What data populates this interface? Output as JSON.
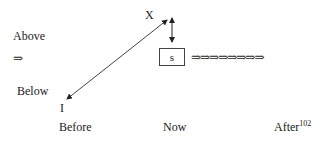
{
  "labels": {
    "above": "Above",
    "above_arrow": "⇒",
    "below": "Below",
    "x": "X",
    "i": "I",
    "box": "s",
    "before": "Before",
    "now": "Now",
    "after": "After",
    "after_sup": "102"
  },
  "arrow_chain": "⇒⇒⇒⇒⇒⇒⇒⇒"
}
